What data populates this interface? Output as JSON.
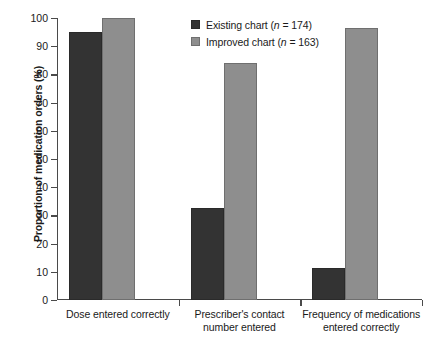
{
  "chart_data": {
    "type": "bar",
    "title": "",
    "xlabel": "",
    "ylabel": "Proportion of medication orders (%)",
    "ylim": [
      0,
      100
    ],
    "yticks": [
      0,
      10,
      20,
      30,
      40,
      50,
      60,
      70,
      80,
      90,
      100
    ],
    "ytick_labels": [
      "0",
      "10",
      "20",
      "30",
      "40",
      "50",
      "60",
      "70",
      "80",
      "90",
      "100"
    ],
    "grid": false,
    "legend_position": "top-center",
    "categories": [
      "Dose entered correctly",
      "Prescriber's contact number entered",
      "Frequency of medications entered correctly"
    ],
    "category_lines": [
      [
        "Dose entered correctly"
      ],
      [
        "Prescriber's contact",
        "number entered"
      ],
      [
        "Frequency of medications",
        "entered correctly"
      ]
    ],
    "series": [
      {
        "name": "Existing chart",
        "n": 174,
        "legend_label_prefix": "Existing chart (",
        "legend_label_italic": "n",
        "legend_label_suffix": " = 174)",
        "color": "#333333",
        "values": [
          95,
          32.5,
          11.5
        ]
      },
      {
        "name": "Improved chart",
        "n": 163,
        "legend_label_prefix": "Improved chart (",
        "legend_label_italic": "n",
        "legend_label_suffix": " = 163)",
        "color": "#8e8e8e",
        "values": [
          100,
          84,
          96.5
        ]
      }
    ]
  }
}
